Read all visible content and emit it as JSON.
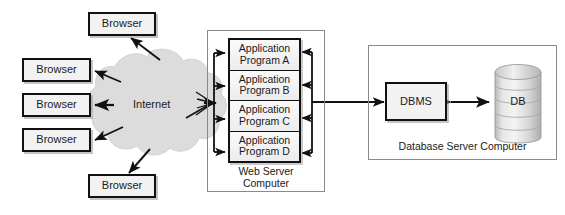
{
  "diagram": {
    "colors": {
      "box_fill": "#f2f2f2",
      "box_stroke": "#111111",
      "frame_stroke": "#8a8a8a",
      "cloud_fill": "#dcdcdc",
      "cylinder_fill": "#d9d9d9",
      "arrow": "#111111",
      "background": "#ffffff"
    },
    "clients": {
      "label": "Browser",
      "count": 5,
      "items": [
        {
          "label": "Browser"
        },
        {
          "label": "Browser"
        },
        {
          "label": "Browser"
        },
        {
          "label": "Browser"
        },
        {
          "label": "Browser"
        }
      ]
    },
    "network": {
      "label": "Internet",
      "shape": "cloud-icon"
    },
    "web_server": {
      "frame_label": "Web Server\nComputer",
      "programs": [
        {
          "label": "Application\nProgram A"
        },
        {
          "label": "Application\nProgram B"
        },
        {
          "label": "Application\nProgram C"
        },
        {
          "label": "Application\nProgram D"
        }
      ]
    },
    "database_server": {
      "frame_label": "Database Server Computer",
      "dbms": {
        "label": "DBMS"
      },
      "database": {
        "label": "DB",
        "shape": "cylinder-icon"
      }
    },
    "connections": [
      {
        "from": "browser-1",
        "to": "internet",
        "direction": "bidirectional"
      },
      {
        "from": "browser-2",
        "to": "internet",
        "direction": "bidirectional"
      },
      {
        "from": "browser-3",
        "to": "internet",
        "direction": "bidirectional"
      },
      {
        "from": "browser-4",
        "to": "internet",
        "direction": "bidirectional"
      },
      {
        "from": "browser-5",
        "to": "internet",
        "direction": "bidirectional"
      },
      {
        "from": "internet",
        "to": "application-programs",
        "direction": "to-programs"
      },
      {
        "from": "application-programs",
        "to": "internet",
        "direction": "to-internet"
      },
      {
        "from": "web-server",
        "to": "dbms",
        "direction": "to-dbms"
      },
      {
        "from": "dbms",
        "to": "database",
        "direction": "bidirectional"
      }
    ]
  }
}
